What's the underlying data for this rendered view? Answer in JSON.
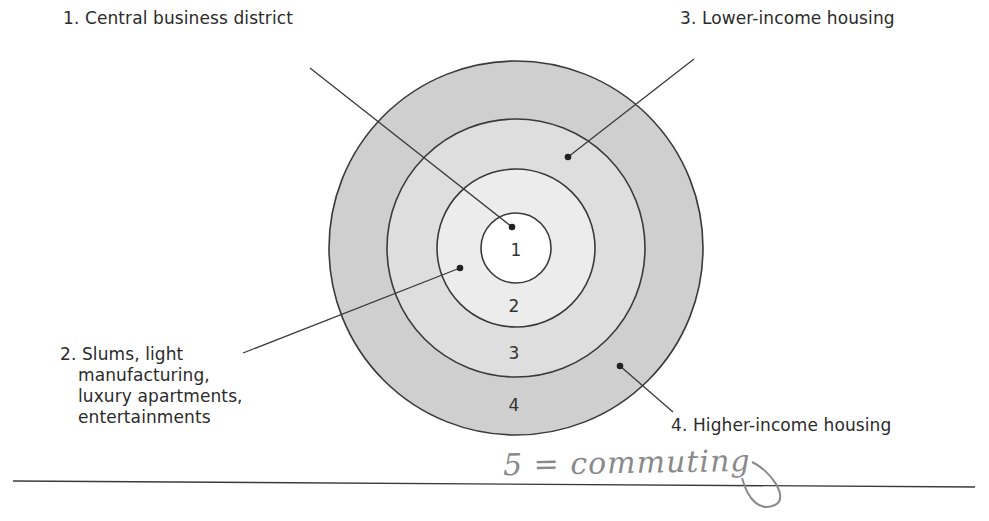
{
  "diagram": {
    "title": "",
    "type": "concentric-zone-model",
    "center": [
      516,
      248
    ],
    "colors": {
      "zone1_fill": "#ffffff",
      "zone2_fill": "#ececec",
      "zone3_fill": "#dedede",
      "zone4_fill": "#cfcfcf",
      "stroke": "#3a3a3a",
      "handwriting": "#8a8a8a"
    },
    "zones": [
      {
        "number": "1",
        "radius": 35,
        "label": "1. Central business district"
      },
      {
        "number": "2",
        "radius": 80,
        "label_lines": [
          "2. Slums, light",
          "manufacturing,",
          "luxury apartments,",
          "entertainments"
        ]
      },
      {
        "number": "3",
        "radius": 129,
        "label": "3. Lower-income housing"
      },
      {
        "number": "4",
        "radius": 187,
        "label": "4. Higher-income housing"
      }
    ],
    "annotation": {
      "handwritten_text": "5 = commuting"
    }
  }
}
